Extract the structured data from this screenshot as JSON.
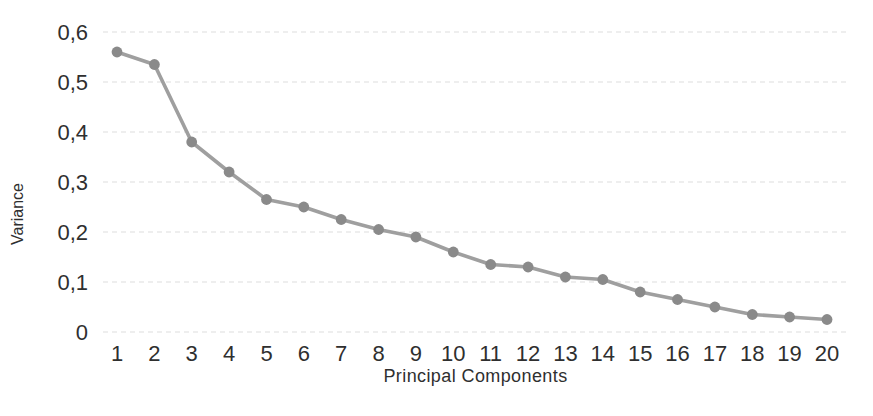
{
  "chart_data": {
    "type": "line",
    "title": "",
    "xlabel": "Principal Components",
    "ylabel": "Variance",
    "categories": [
      "1",
      "2",
      "3",
      "4",
      "5",
      "6",
      "7",
      "8",
      "9",
      "10",
      "11",
      "12",
      "13",
      "14",
      "15",
      "16",
      "17",
      "18",
      "19",
      "20"
    ],
    "values": [
      0.56,
      0.535,
      0.38,
      0.32,
      0.265,
      0.25,
      0.225,
      0.205,
      0.19,
      0.16,
      0.135,
      0.13,
      0.11,
      0.105,
      0.08,
      0.065,
      0.05,
      0.035,
      0.03,
      0.025
    ],
    "ylim": [
      0,
      0.6
    ],
    "y_ticks": {
      "values": [
        0,
        0.1,
        0.2,
        0.3,
        0.4,
        0.5,
        0.6
      ],
      "labels": [
        "0",
        "0,1",
        "0,2",
        "0,3",
        "0,4",
        "0,5",
        "0,6"
      ]
    },
    "grid": "horizontal-dotted",
    "legend": "none",
    "marker": "circle",
    "colors": {
      "line": "#9f9f9f",
      "marker": "#8a8a8a",
      "grid": "#dedede",
      "text": "#2f2f2f",
      "background": "#ffffff"
    }
  }
}
